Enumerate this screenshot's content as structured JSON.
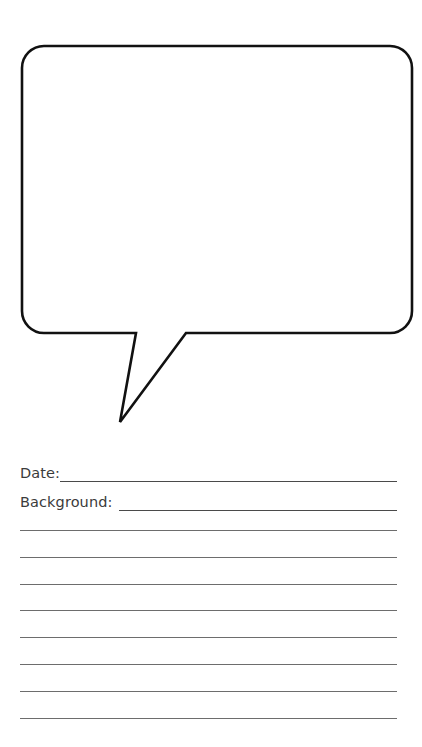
{
  "page": {
    "type": "printable-worksheet",
    "background_color": "#ffffff"
  },
  "bubble": {
    "name": "speech-bubble",
    "stroke_color": "#111111",
    "fill_color": "#ffffff",
    "stroke_width": 2.6,
    "corner_radius": 22,
    "body": {
      "x": 22,
      "y": 46,
      "width": 390,
      "height": 288
    },
    "tail": {
      "attach_left_x": 136,
      "attach_right_x": 186,
      "attach_y": 333,
      "tip_x": 120,
      "tip_y": 422
    },
    "content": ""
  },
  "fields": [
    {
      "name": "date",
      "label": "Date:",
      "value": "",
      "rule_color": "#4a4a4a"
    },
    {
      "name": "background",
      "label": "Background:",
      "value": "",
      "rule_color": "#4a4a4a"
    }
  ],
  "blank_lines": {
    "count": 8,
    "color": "#6d6d6d",
    "start_y": 90,
    "spacing": 26.8,
    "left_x": 20,
    "right_x": 397,
    "values": [
      "",
      "",
      "",
      "",
      "",
      "",
      "",
      ""
    ]
  }
}
